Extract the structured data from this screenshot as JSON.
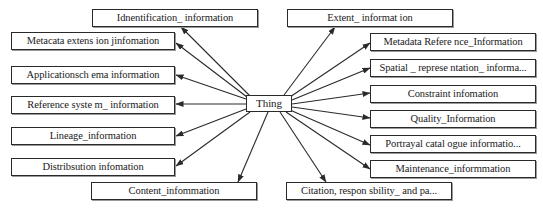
{
  "diagram": {
    "type": "hub-and-spoke class diagram",
    "center": {
      "label": "Thing",
      "box": {
        "x": 246,
        "y": 95,
        "w": 46,
        "h": 17
      }
    },
    "nodes": [
      {
        "id": "identification",
        "label": "Idnentification_ information",
        "box": {
          "x": 92,
          "y": 9,
          "w": 166,
          "h": 18
        },
        "arrow_from": [
          250,
          96
        ],
        "arrow_to": [
          181,
          27
        ]
      },
      {
        "id": "metacata-extension",
        "label": "Metacata extens ion jinfomation",
        "box": {
          "x": 11,
          "y": 32,
          "w": 164,
          "h": 18
        },
        "arrow_from": [
          247,
          97
        ],
        "arrow_to": [
          176,
          43
        ]
      },
      {
        "id": "application-schema",
        "label": "Applicationsch ema information",
        "box": {
          "x": 11,
          "y": 66,
          "w": 164,
          "h": 18
        },
        "arrow_from": [
          246,
          99
        ],
        "arrow_to": [
          176,
          75
        ]
      },
      {
        "id": "reference-system",
        "label": "Reference syste  m_ information",
        "box": {
          "x": 11,
          "y": 96,
          "w": 164,
          "h": 18
        },
        "arrow_from": [
          246,
          104
        ],
        "arrow_to": [
          176,
          104
        ]
      },
      {
        "id": "lineage",
        "label": "Lineage_information",
        "box": {
          "x": 11,
          "y": 127,
          "w": 164,
          "h": 18
        },
        "arrow_from": [
          246,
          109
        ],
        "arrow_to": [
          176,
          136
        ]
      },
      {
        "id": "distribution",
        "label": "Distribsution infomation",
        "box": {
          "x": 11,
          "y": 158,
          "w": 164,
          "h": 18
        },
        "arrow_from": [
          250,
          112
        ],
        "arrow_to": [
          176,
          166
        ]
      },
      {
        "id": "content",
        "label": "Content_infommation",
        "box": {
          "x": 91,
          "y": 182,
          "w": 166,
          "h": 18
        },
        "arrow_from": [
          268,
          112
        ],
        "arrow_to": [
          238,
          182
        ]
      },
      {
        "id": "extent",
        "label": "Extent_ informat ion",
        "box": {
          "x": 287,
          "y": 9,
          "w": 166,
          "h": 18
        },
        "arrow_from": [
          284,
          95
        ],
        "arrow_to": [
          335,
          27
        ]
      },
      {
        "id": "metadata-reference",
        "label": "Metadata Refere nce_Information",
        "box": {
          "x": 370,
          "y": 33,
          "w": 166,
          "h": 18
        },
        "arrow_from": [
          290,
          97
        ],
        "arrow_to": [
          370,
          43
        ]
      },
      {
        "id": "spatial-representation",
        "label": "Spatial _ represe ntation_ informa...",
        "box": {
          "x": 370,
          "y": 59,
          "w": 166,
          "h": 18
        },
        "arrow_from": [
          292,
          100
        ],
        "arrow_to": [
          370,
          68
        ]
      },
      {
        "id": "constraint",
        "label": "Constraint  infomation",
        "box": {
          "x": 370,
          "y": 85,
          "w": 166,
          "h": 18
        },
        "arrow_from": [
          292,
          104
        ],
        "arrow_to": [
          370,
          93
        ]
      },
      {
        "id": "quality",
        "label": "Quality_Information",
        "box": {
          "x": 370,
          "y": 110,
          "w": 166,
          "h": 18
        },
        "arrow_from": [
          292,
          107
        ],
        "arrow_to": [
          370,
          118
        ]
      },
      {
        "id": "portrayal-catalogue",
        "label": "Portrayal catal ogue informatio...",
        "box": {
          "x": 370,
          "y": 135,
          "w": 166,
          "h": 18
        },
        "arrow_from": [
          290,
          110
        ],
        "arrow_to": [
          370,
          145
        ]
      },
      {
        "id": "maintenance",
        "label": "Maintenance_informmation",
        "box": {
          "x": 370,
          "y": 160,
          "w": 166,
          "h": 18
        },
        "arrow_from": [
          286,
          112
        ],
        "arrow_to": [
          370,
          169
        ]
      },
      {
        "id": "citation",
        "label": "Citation, respon sbility_ and pa...",
        "box": {
          "x": 286,
          "y": 182,
          "w": 166,
          "h": 18
        },
        "arrow_from": [
          280,
          112
        ],
        "arrow_to": [
          326,
          182
        ]
      }
    ],
    "colors": {
      "stroke": "#2a2a2a",
      "background": "#ffffff",
      "text": "#1a1a1a"
    }
  }
}
